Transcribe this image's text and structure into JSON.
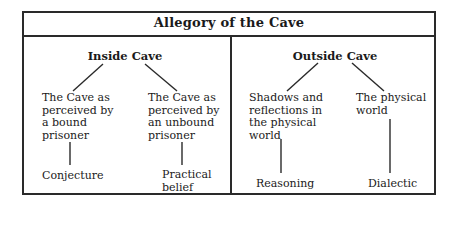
{
  "title": "Allegory of the Cave",
  "sections": [
    {
      "heading": "Inside Cave",
      "children": [
        {
          "label": "The Cave as\nperceived by\na bound\nprisoner",
          "leaf": "Conjecture"
        },
        {
          "label": "The Cave as\nperceived by\nan unbound\nprisoner",
          "leaf": "Practical\nbelief"
        }
      ]
    },
    {
      "heading": "Outside Cave",
      "children": [
        {
          "label": "Shadows and\nreflections in\nthe physical\nworld",
          "leaf": "Reasoning"
        },
        {
          "label": "The physical\nworld",
          "leaf": "Dialectic"
        }
      ]
    }
  ],
  "colors": {
    "line": "#2a2a2a",
    "text": "#1a1a1a",
    "background": "#ffffff"
  }
}
